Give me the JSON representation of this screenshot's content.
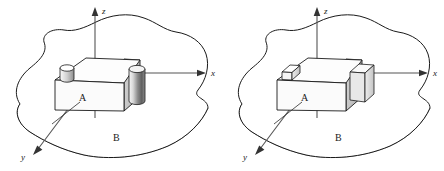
{
  "figure": {
    "panel_count": 2
  },
  "colors": {
    "outline": "#1a1a1a",
    "axis": "#555555",
    "face_top": "#fdfdfd",
    "face_front": "#fbfbfb",
    "face_side": "#c9c9c9",
    "feature_light": "#f2f2f2",
    "feature_mid": "#b8b8b8",
    "feature_dark": "#6e6e6e",
    "edge_dark": "#2b2b2b",
    "edge_light": "#ededed",
    "background": "#ffffff"
  },
  "panels": [
    {
      "id": "left",
      "variant": "cylindrical",
      "axes": {
        "z": {
          "label": "z",
          "direction": "up"
        },
        "x": {
          "label": "x",
          "direction": "right"
        },
        "y": {
          "label": "y",
          "direction": "down-left"
        }
      },
      "labels": {
        "block": "A",
        "surface": "B"
      },
      "features": [
        {
          "name": "boss-cylinder-top-left",
          "shape": "cylinder"
        },
        {
          "name": "boss-cylinder-right",
          "shape": "cylinder"
        }
      ]
    },
    {
      "id": "right",
      "variant": "prismatic",
      "axes": {
        "z": {
          "label": "z",
          "direction": "up"
        },
        "x": {
          "label": "x",
          "direction": "right"
        },
        "y": {
          "label": "y",
          "direction": "down-left"
        }
      },
      "labels": {
        "block": "A",
        "surface": "B"
      },
      "features": [
        {
          "name": "boss-box-top-left",
          "shape": "rectangular-prism"
        },
        {
          "name": "boss-box-right",
          "shape": "rectangular-prism"
        }
      ]
    }
  ]
}
